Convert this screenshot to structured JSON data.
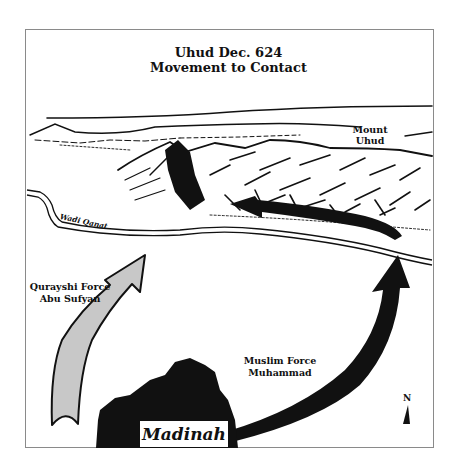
{
  "map": {
    "title_line1": "Uhud Dec. 624",
    "title_line2": "Movement to Contact",
    "landmarks": {
      "mount_line1": "Mount",
      "mount_line2": "Uhud",
      "wadi": "Wadi Qanat",
      "city": "Madinah"
    },
    "forces": [
      {
        "line1": "Qurayshi Force",
        "line2": "Abu Sufyan",
        "arrow_color": "#c8c8c8"
      },
      {
        "line1": "Muslim Force",
        "line2": "Muhammad",
        "arrow_color": "#111111"
      }
    ],
    "compass": {
      "label": "N"
    },
    "colors": {
      "border": "#8a8a8a",
      "ink": "#111111",
      "quraysh_fill": "#c8c8c8"
    }
  }
}
